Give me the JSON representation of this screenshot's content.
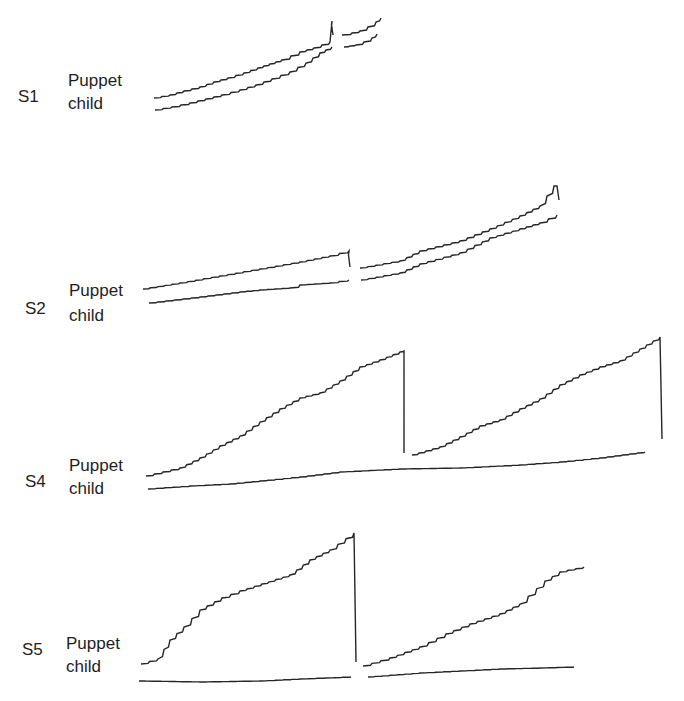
{
  "chart_data": {
    "type": "line",
    "title": "",
    "panels": [
      {
        "subject": "S1",
        "series": [
          {
            "name": "Puppet",
            "segments": [
              {
                "x": [
                  154,
                  170,
                  184,
                  200,
                  214,
                  228,
                  244,
                  258,
                  270,
                  282,
                  300,
                  314,
                  330,
                  332,
                  333
                ],
                "y": [
                  98,
                  95,
                  91,
                  87,
                  82,
                  78,
                  73,
                  68,
                  64,
                  60,
                  52,
                  48,
                  42,
                  21,
                  35
                ]
              },
              {
                "x": [
                  342,
                  352,
                  360,
                  368,
                  376,
                  381
                ],
                "y": [
                  35,
                  33,
                  31,
                  27,
                  22,
                  18
                ]
              }
            ]
          },
          {
            "name": "child",
            "segments": [
              {
                "x": [
                  155,
                  172,
                  190,
                  206,
                  222,
                  240,
                  256,
                  272,
                  290,
                  306,
                  320,
                  332
                ],
                "y": [
                  110,
                  107,
                  103,
                  99,
                  95,
                  90,
                  85,
                  79,
                  72,
                  63,
                  53,
                  47
                ]
              },
              {
                "x": [
                  344,
                  356,
                  364,
                  372,
                  377
                ],
                "y": [
                  47,
                  45,
                  42,
                  38,
                  34
                ]
              }
            ]
          }
        ]
      },
      {
        "subject": "S2",
        "series": [
          {
            "name": "Puppet",
            "segments": [
              {
                "x": [
                  143,
                  180,
                  220,
                  260,
                  300,
                  330,
                  349,
                  349,
                  350
                ],
                "y": [
                  289,
                  283,
                  276,
                  269,
                  262,
                  256,
                  251,
                  251,
                  267
                ]
              },
              {
                "x": [
                  360,
                  400,
                  420,
                  460,
                  490,
                  520,
                  540,
                  554,
                  557,
                  559
                ],
                "y": [
                  268,
                  261,
                  251,
                  241,
                  229,
                  216,
                  206,
                  186,
                  186,
                  200
                ]
              }
            ]
          },
          {
            "name": "child",
            "segments": [
              {
                "x": [
                  149,
                  200,
                  240,
                  260,
                  290,
                  300,
                  330,
                  349
                ],
                "y": [
                  303,
                  297,
                  292,
                  290,
                  288,
                  285,
                  283,
                  280
                ]
              },
              {
                "x": [
                  361,
                  400,
                  420,
                  460,
                  490,
                  520,
                  540,
                  557
                ],
                "y": [
                  280,
                  273,
                  264,
                  253,
                  238,
                  229,
                  223,
                  215
                ]
              }
            ]
          }
        ]
      },
      {
        "subject": "S4",
        "series": [
          {
            "name": "Puppet",
            "segments": [
              {
                "x": [
                  146,
                  180,
                  200,
                  220,
                  240,
                  260,
                  280,
                  300,
                  320,
                  340,
                  360,
                  380,
                  400,
                  404,
                  404
                ],
                "y": [
                  476,
                  468,
                  458,
                  446,
                  436,
                  422,
                  409,
                  398,
                  393,
                  381,
                  367,
                  360,
                  352,
                  351,
                  453
                ]
              },
              {
                "x": [
                  412,
                  440,
                  460,
                  480,
                  500,
                  520,
                  540,
                  560,
                  580,
                  600,
                  620,
                  640,
                  660,
                  662
                ],
                "y": [
                  455,
                  447,
                  437,
                  426,
                  420,
                  409,
                  399,
                  385,
                  375,
                  367,
                  361,
                  349,
                  337,
                  439
                ]
              }
            ]
          },
          {
            "name": "child",
            "segments": [
              {
                "x": [
                  148,
                  190,
                  230,
                  260,
                  300,
                  340,
                  400,
                  460,
                  520,
                  560,
                  600,
                  645
                ],
                "y": [
                  489,
                  486,
                  484,
                  481,
                  477,
                  472,
                  469,
                  468,
                  465,
                  462,
                  458,
                  452
                ]
              }
            ]
          }
        ]
      },
      {
        "subject": "S5",
        "series": [
          {
            "name": "Puppet",
            "segments": [
              {
                "x": [
                  141,
                  158,
                  170,
                  184,
                  200,
                  222,
                  240,
                  262,
                  290,
                  310,
                  330,
                  354,
                  356
                ],
                "y": [
                  664,
                  659,
                  640,
                  627,
                  610,
                  598,
                  591,
                  584,
                  575,
                  560,
                  550,
                  533,
                  662
                ]
              },
              {
                "x": [
                  363,
                  390,
                  420,
                  446,
                  470,
                  500,
                  520,
                  545,
                  560,
                  584
                ],
                "y": [
                  666,
                  658,
                  647,
                  634,
                  624,
                  614,
                  604,
                  581,
                  572,
                  567
                ]
              }
            ]
          },
          {
            "name": "child",
            "segments": [
              {
                "x": [
                  139,
                  200,
                  260,
                  300,
                  351
                ],
                "y": [
                  681,
                  682,
                  681,
                  679,
                  677
                ]
              },
              {
                "x": [
                  368,
                  420,
                  460,
                  500,
                  540,
                  574
                ],
                "y": [
                  677,
                  673,
                  671,
                  669,
                  668,
                  667
                ]
              }
            ]
          }
        ]
      }
    ],
    "legend": [
      "Puppet",
      "child"
    ],
    "xlabel": "",
    "ylabel": "",
    "grid": false
  },
  "labels": {
    "s1": {
      "subject": "S1",
      "line1": "Puppet",
      "line2": "child"
    },
    "s2": {
      "subject": "S2",
      "line1": "Puppet",
      "line2": "child"
    },
    "s4": {
      "subject": "S4",
      "line1": "Puppet",
      "line2": "child"
    },
    "s5": {
      "subject": "S5",
      "line1": "Puppet",
      "line2": "child"
    }
  },
  "colors": {
    "ink": "#262626",
    "background": "#ffffff"
  }
}
